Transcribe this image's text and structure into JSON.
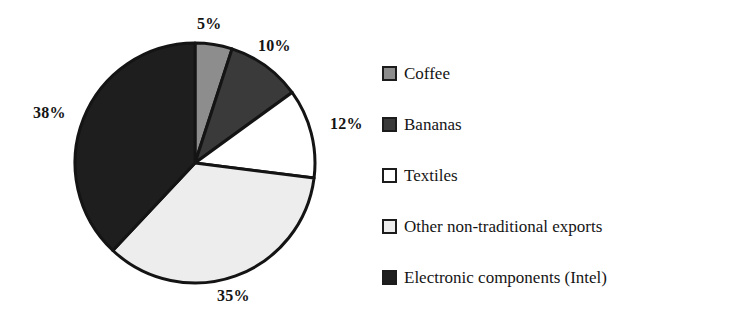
{
  "chart_data": {
    "type": "pie",
    "title": "",
    "subtitle": "",
    "xlabel": "",
    "ylabel": "",
    "grid": false,
    "legend_position": "right",
    "start_angle_deg": 0,
    "direction": "clockwise",
    "categories": [
      "Coffee",
      "Bananas",
      "Textiles",
      "Other non-traditional exports",
      "Electronic components (Intel)"
    ],
    "values": [
      5,
      10,
      12,
      35,
      38
    ],
    "data_labels": [
      "5%",
      "10%",
      "12%",
      "35%",
      "38%"
    ],
    "slice_colors": [
      "#8d8d8d",
      "#3a3a3a",
      "#ffffff",
      "#ededed",
      "#1e1e1e"
    ],
    "slice_edge_color": "#141414",
    "slices": [
      {
        "label": "Coffee",
        "value": 5,
        "display": "5%",
        "color": "#8d8d8d"
      },
      {
        "label": "Bananas",
        "value": 10,
        "display": "10%",
        "color": "#3a3a3a"
      },
      {
        "label": "Textiles",
        "value": 12,
        "display": "12%",
        "color": "#ffffff"
      },
      {
        "label": "Other non-traditional exports",
        "value": 35,
        "display": "35%",
        "color": "#ededed"
      },
      {
        "label": "Electronic components (Intel)",
        "value": 38,
        "display": "38%",
        "color": "#1e1e1e"
      }
    ]
  },
  "pie": {
    "labels": {
      "coffee_pct": "5%",
      "bananas_pct": "10%",
      "textiles_pct": "12%",
      "other_pct": "35%",
      "electronic_pct": "38%"
    }
  },
  "legend": {
    "items": [
      {
        "label": "Coffee",
        "color": "#8d8d8d"
      },
      {
        "label": "Bananas",
        "color": "#3a3a3a"
      },
      {
        "label": "Textiles",
        "color": "#ffffff"
      },
      {
        "label": "Other non-traditional exports",
        "color": "#ededed"
      },
      {
        "label": "Electronic components (Intel)",
        "color": "#1e1e1e"
      }
    ]
  }
}
